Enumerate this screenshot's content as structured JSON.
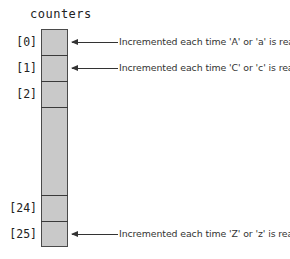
{
  "diagram": {
    "title": "counters",
    "fill_color": "#c9c9c9",
    "border_color": "#4a4a4a",
    "index_labels": [
      "[0]",
      "[1]",
      "[2]",
      "[24]",
      "[25]"
    ],
    "annotations": [
      {
        "index": "[0]",
        "text": "Incremented each time 'A' or 'a' is read"
      },
      {
        "index": "[1]",
        "text": "Incremented each time 'C' or 'c' is read"
      },
      {
        "index": "[25]",
        "text": "Incremented each time 'Z' or 'z' is read"
      }
    ]
  }
}
